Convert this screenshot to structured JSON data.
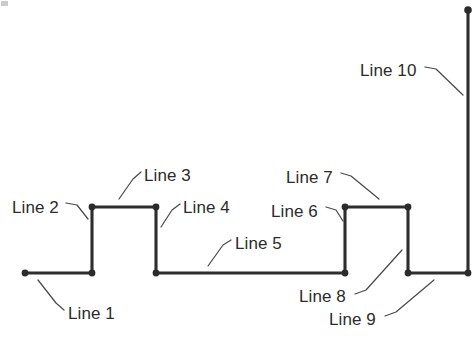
{
  "figure": {
    "background_color": "#ffffff",
    "stroke_color": "#2e2e2e",
    "leader_color": "#4a4a4a",
    "label_color": "#2b2b2b"
  },
  "chart_data": {
    "type": "line",
    "title": "",
    "xlabel": "",
    "ylabel": "",
    "grid": false,
    "legend": "none",
    "xlim": [
      0,
      475
    ],
    "ylim": [
      338,
      0
    ],
    "vertices": [
      {
        "x": 25,
        "y": 273
      },
      {
        "x": 92,
        "y": 273
      },
      {
        "x": 92,
        "y": 207
      },
      {
        "x": 156,
        "y": 207
      },
      {
        "x": 156,
        "y": 273
      },
      {
        "x": 345,
        "y": 273
      },
      {
        "x": 345,
        "y": 207
      },
      {
        "x": 408,
        "y": 207
      },
      {
        "x": 408,
        "y": 273
      },
      {
        "x": 468,
        "y": 273
      },
      {
        "x": 468,
        "y": 10
      }
    ],
    "segments": [
      {
        "label": "Line 1",
        "orientation": "horizontal",
        "from": [
          25,
          273
        ],
        "to": [
          92,
          273
        ],
        "length": 67
      },
      {
        "label": "Line 2",
        "orientation": "vertical",
        "from": [
          92,
          273
        ],
        "to": [
          92,
          207
        ],
        "length": 66
      },
      {
        "label": "Line 3",
        "orientation": "horizontal",
        "from": [
          92,
          207
        ],
        "to": [
          156,
          207
        ],
        "length": 64
      },
      {
        "label": "Line 4",
        "orientation": "vertical",
        "from": [
          156,
          207
        ],
        "to": [
          156,
          273
        ],
        "length": 66
      },
      {
        "label": "Line 5",
        "orientation": "horizontal",
        "from": [
          156,
          273
        ],
        "to": [
          345,
          273
        ],
        "length": 189
      },
      {
        "label": "Line 6",
        "orientation": "vertical",
        "from": [
          345,
          273
        ],
        "to": [
          345,
          207
        ],
        "length": 66
      },
      {
        "label": "Line 7",
        "orientation": "horizontal",
        "from": [
          345,
          207
        ],
        "to": [
          408,
          207
        ],
        "length": 63
      },
      {
        "label": "Line 8",
        "orientation": "vertical",
        "from": [
          408,
          207
        ],
        "to": [
          408,
          273
        ],
        "length": 66
      },
      {
        "label": "Line 9",
        "orientation": "horizontal",
        "from": [
          408,
          273
        ],
        "to": [
          468,
          273
        ],
        "length": 60
      },
      {
        "label": "Line 10",
        "orientation": "vertical",
        "from": [
          468,
          273
        ],
        "to": [
          468,
          10
        ],
        "length": 263
      }
    ]
  },
  "geometry": {
    "polyline_path": "M 25 273 L 92 273 L 92 207 L 156 207 L 156 273 L 345 273 L 345 207 L 408 207 L 408 273 L 468 273 L 468 10",
    "endpoint_dots": [
      {
        "cx": 25,
        "cy": 273,
        "r": 3.4
      },
      {
        "cx": 92,
        "cy": 273,
        "r": 3.4
      },
      {
        "cx": 92,
        "cy": 207,
        "r": 3.4
      },
      {
        "cx": 156,
        "cy": 207,
        "r": 3.4
      },
      {
        "cx": 156,
        "cy": 273,
        "r": 3.4
      },
      {
        "cx": 345,
        "cy": 273,
        "r": 3.4
      },
      {
        "cx": 345,
        "cy": 207,
        "r": 3.4
      },
      {
        "cx": 408,
        "cy": 207,
        "r": 3.4
      },
      {
        "cx": 408,
        "cy": 273,
        "r": 3.4
      },
      {
        "cx": 468,
        "cy": 273,
        "r": 3.4
      },
      {
        "cx": 468,
        "cy": 10,
        "r": 3.8
      }
    ]
  },
  "callouts": [
    {
      "id": "line-1",
      "label": "Line 1",
      "label_left": 68,
      "label_top": 305,
      "leader_path": "M 64 310 L 56 303 L 38 280"
    },
    {
      "id": "line-2",
      "label": "Line 2",
      "label_left": 12,
      "label_top": 199,
      "leader_path": "M 66 203 L 77 205 L 88 219"
    },
    {
      "id": "line-3",
      "label": "Line 3",
      "label_left": 144,
      "label_top": 167,
      "leader_path": "M 141 172 L 133 179 L 119 199"
    },
    {
      "id": "line-4",
      "label": "Line 4",
      "label_left": 183,
      "label_top": 199,
      "leader_path": "M 180 204 L 172 210 L 161 227"
    },
    {
      "id": "line-5",
      "label": "Line 5",
      "label_left": 235,
      "label_top": 235,
      "leader_path": "M 231 240 L 223 245 L 208 266"
    },
    {
      "id": "line-6",
      "label": "Line 6",
      "label_left": 271,
      "label_top": 203,
      "leader_path": "M 326 207 L 336 210 L 343 221"
    },
    {
      "id": "line-7",
      "label": "Line 7",
      "label_left": 286,
      "label_top": 169,
      "leader_path": "M 341 173 L 351 176 L 379 199"
    },
    {
      "id": "line-8",
      "label": "Line 8",
      "label_left": 299,
      "label_top": 288,
      "leader_path": "M 355 294 L 366 290 L 402 250"
    },
    {
      "id": "line-9",
      "label": "Line 9",
      "label_left": 329,
      "label_top": 311,
      "leader_path": "M 385 316 L 396 312 L 434 280"
    },
    {
      "id": "line-10",
      "label": "Line 10",
      "label_left": 360,
      "label_top": 62,
      "leader_path": "M 425 67 L 436 69 L 463 95"
    }
  ]
}
